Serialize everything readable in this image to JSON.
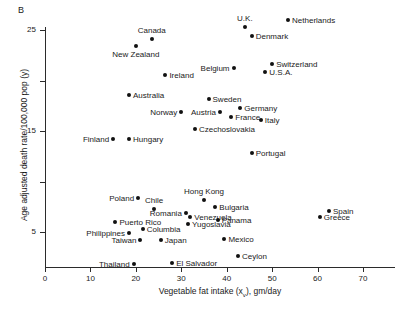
{
  "figure": {
    "panel_label": "B"
  },
  "chart_data": {
    "type": "scatter",
    "title": "",
    "xlabel": "Vegetable fat intake (xᵥ), gm/day",
    "ylabel": "Age adjusted death rate/100,000 pop (y)",
    "xlim": [
      0,
      77
    ],
    "ylim": [
      0,
      27
    ],
    "xticks": [
      0,
      10,
      20,
      30,
      40,
      50,
      60,
      70
    ],
    "xtick_labels": [
      "0",
      "10",
      "20",
      "30",
      "40",
      "50",
      "60",
      "70"
    ],
    "yticks": [
      5,
      10,
      15,
      20,
      25
    ],
    "ytick_labels": [
      "5",
      "",
      "15",
      "",
      "25"
    ],
    "grid": false,
    "legend": false,
    "point_labels": true,
    "points": [
      {
        "name": "Netherlands",
        "x": 53.5,
        "y": 26.0,
        "label_pos": "right"
      },
      {
        "name": "U.K.",
        "x": 44.0,
        "y": 25.3,
        "label_pos": "above"
      },
      {
        "name": "Canada",
        "x": 23.5,
        "y": 24.1,
        "label_pos": "above"
      },
      {
        "name": "Denmark",
        "x": 45.5,
        "y": 24.4,
        "label_pos": "right"
      },
      {
        "name": "New Zealand",
        "x": 20.0,
        "y": 23.4,
        "label_pos": "below"
      },
      {
        "name": "Switzerland",
        "x": 50.0,
        "y": 21.6,
        "label_pos": "right"
      },
      {
        "name": "Belgium",
        "x": 41.5,
        "y": 21.2,
        "label_pos": "left"
      },
      {
        "name": "U.S.A.",
        "x": 48.5,
        "y": 20.8,
        "label_pos": "right"
      },
      {
        "name": "Ireland",
        "x": 26.5,
        "y": 20.5,
        "label_pos": "right"
      },
      {
        "name": "Australia",
        "x": 18.5,
        "y": 18.6,
        "label_pos": "right"
      },
      {
        "name": "Sweden",
        "x": 36.0,
        "y": 18.2,
        "label_pos": "right"
      },
      {
        "name": "Germany",
        "x": 43.0,
        "y": 17.3,
        "label_pos": "right"
      },
      {
        "name": "Norway",
        "x": 30.0,
        "y": 16.9,
        "label_pos": "left"
      },
      {
        "name": "Austria",
        "x": 38.5,
        "y": 16.9,
        "label_pos": "left"
      },
      {
        "name": "France",
        "x": 41.0,
        "y": 16.4,
        "label_pos": "right"
      },
      {
        "name": "Italy",
        "x": 47.5,
        "y": 16.1,
        "label_pos": "right"
      },
      {
        "name": "Czechoslovakia",
        "x": 33.0,
        "y": 15.2,
        "label_pos": "right"
      },
      {
        "name": "Finland",
        "x": 15.0,
        "y": 14.2,
        "label_pos": "left"
      },
      {
        "name": "Hungary",
        "x": 18.5,
        "y": 14.2,
        "label_pos": "right"
      },
      {
        "name": "Portugal",
        "x": 45.5,
        "y": 12.8,
        "label_pos": "right"
      },
      {
        "name": "Poland",
        "x": 20.5,
        "y": 8.4,
        "label_pos": "left"
      },
      {
        "name": "Hong Kong",
        "x": 35.0,
        "y": 8.2,
        "label_pos": "above"
      },
      {
        "name": "Spain",
        "x": 62.5,
        "y": 7.1,
        "label_pos": "right"
      },
      {
        "name": "Chile",
        "x": 24.0,
        "y": 7.3,
        "label_pos": "above"
      },
      {
        "name": "Bulgaria",
        "x": 37.5,
        "y": 7.5,
        "label_pos": "right"
      },
      {
        "name": "Greece",
        "x": 60.5,
        "y": 6.5,
        "label_pos": "right"
      },
      {
        "name": "Romania",
        "x": 31.0,
        "y": 6.9,
        "label_pos": "left"
      },
      {
        "name": "Venezuela",
        "x": 32.0,
        "y": 6.5,
        "label_pos": "right"
      },
      {
        "name": "Puerto Rico",
        "x": 15.5,
        "y": 6.0,
        "label_pos": "right"
      },
      {
        "name": "Panama",
        "x": 38.0,
        "y": 6.2,
        "label_pos": "right"
      },
      {
        "name": "Yugoslavia",
        "x": 31.5,
        "y": 5.8,
        "label_pos": "right"
      },
      {
        "name": "Columbia",
        "x": 21.5,
        "y": 5.3,
        "label_pos": "right"
      },
      {
        "name": "Philippines",
        "x": 18.5,
        "y": 4.9,
        "label_pos": "left"
      },
      {
        "name": "Mexico",
        "x": 39.5,
        "y": 4.3,
        "label_pos": "right"
      },
      {
        "name": "Taiwan",
        "x": 21.0,
        "y": 4.2,
        "label_pos": "left"
      },
      {
        "name": "Japan",
        "x": 25.5,
        "y": 4.2,
        "label_pos": "right"
      },
      {
        "name": "Ceylon",
        "x": 42.5,
        "y": 2.6,
        "label_pos": "right"
      },
      {
        "name": "Thailand",
        "x": 19.5,
        "y": 1.8,
        "label_pos": "left"
      },
      {
        "name": "El Salvador",
        "x": 28.0,
        "y": 1.9,
        "label_pos": "right"
      }
    ]
  }
}
